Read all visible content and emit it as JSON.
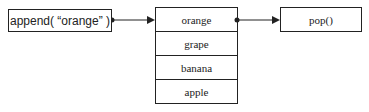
{
  "operations": {
    "push": {
      "label": "append( “orange” )"
    },
    "pop": {
      "label": "pop()"
    }
  },
  "stack": {
    "items": [
      {
        "label": "orange"
      },
      {
        "label": "grape"
      },
      {
        "label": "banana"
      },
      {
        "label": "apple"
      }
    ]
  },
  "colors": {
    "stroke": "#222222",
    "background": "#ffffff"
  }
}
